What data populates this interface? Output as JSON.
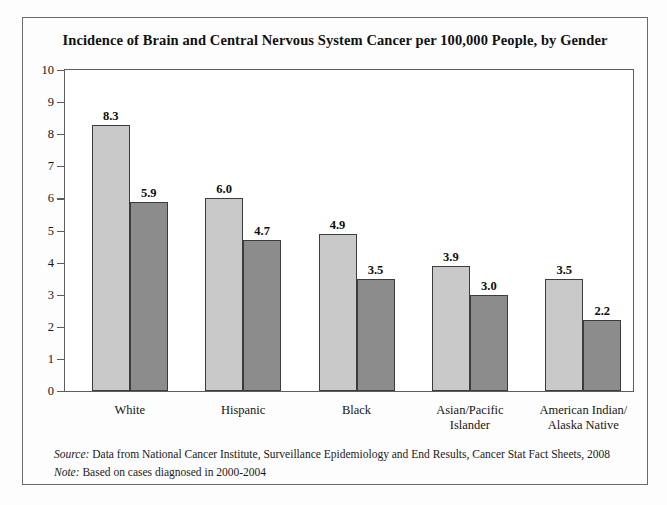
{
  "chart_data": {
    "type": "bar",
    "title": "Incidence of Brain and Central Nervous System Cancer per 100,000 People, by Gender",
    "xlabel": "",
    "ylabel": "",
    "ylim": [
      0,
      10
    ],
    "ytick_step": 1,
    "yticks": [
      "10",
      "9",
      "8",
      "7",
      "6",
      "5",
      "4",
      "3",
      "2",
      "1",
      "0"
    ],
    "grid": false,
    "legend_position": "top-right",
    "categories": [
      "White",
      "Hispanic",
      "Black",
      "Asian/Pacific Islander",
      "American Indian/Alaska Native"
    ],
    "category_label_lines": [
      [
        "White"
      ],
      [
        "Hispanic"
      ],
      [
        "Black"
      ],
      [
        "Asian/Pacific",
        "Islander"
      ],
      [
        "American Indian/",
        "Alaska Native"
      ]
    ],
    "series": [
      {
        "name": "Men",
        "color": "#c9c9c9",
        "values": [
          8.3,
          6.0,
          4.9,
          3.9,
          3.5
        ],
        "labels": [
          "8.3",
          "6.0",
          "4.9",
          "3.9",
          "3.5"
        ]
      },
      {
        "name": "Women",
        "color": "#8c8c8c",
        "values": [
          5.9,
          4.7,
          3.5,
          3.0,
          2.2
        ],
        "labels": [
          "5.9",
          "4.7",
          "3.5",
          "3.0",
          "2.2"
        ]
      }
    ]
  },
  "legend": {
    "items": [
      {
        "label": "Men",
        "color": "#c9c9c9"
      },
      {
        "label": "Women",
        "color": "#8c8c8c"
      }
    ]
  },
  "footnotes": [
    {
      "lead": "Source:",
      "text": " Data from National Cancer Institute, Surveillance Epidemiology and End Results, Cancer Stat Fact Sheets, 2008"
    },
    {
      "lead": "Note:",
      "text": " Based on cases diagnosed in 2000-2004"
    }
  ],
  "colors": {
    "men_bar": "#c9c9c9",
    "women_bar": "#8c8c8c",
    "bar_border": "#3c3c3c",
    "axis": "#5d5d5d",
    "frame": "#6b6b6b",
    "text": "#151515",
    "background": "#fdfdfd"
  }
}
